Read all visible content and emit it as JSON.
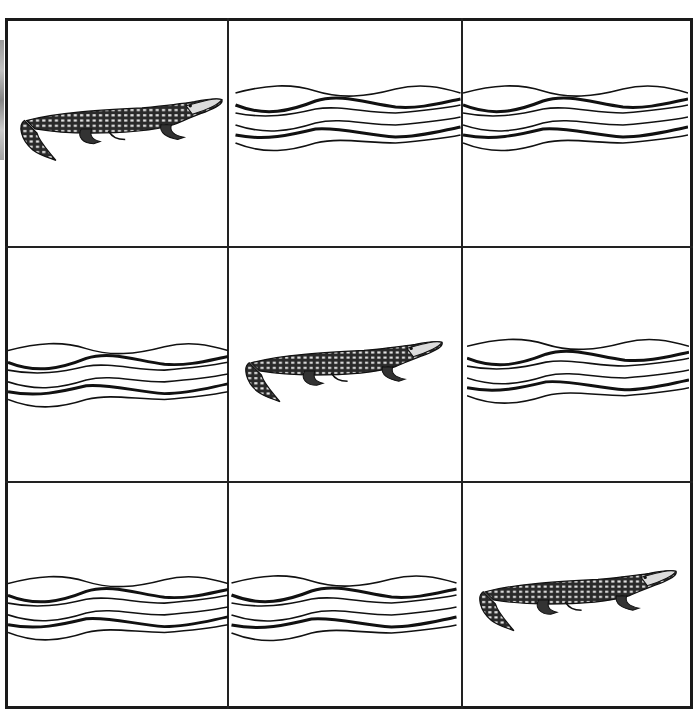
{
  "puzzle": {
    "title": "Crocodile and water grid",
    "rows": 3,
    "cols": 3,
    "cells": [
      {
        "row": 1,
        "col": 1,
        "content": "crocodile"
      },
      {
        "row": 1,
        "col": 2,
        "content": "water"
      },
      {
        "row": 1,
        "col": 3,
        "content": "water"
      },
      {
        "row": 2,
        "col": 1,
        "content": "water"
      },
      {
        "row": 2,
        "col": 2,
        "content": "crocodile"
      },
      {
        "row": 2,
        "col": 3,
        "content": "water"
      },
      {
        "row": 3,
        "col": 1,
        "content": "water"
      },
      {
        "row": 3,
        "col": 2,
        "content": "water"
      },
      {
        "row": 3,
        "col": 3,
        "content": "crocodile"
      }
    ],
    "colors": {
      "ink": "#1a1a1a",
      "background": "#ffffff"
    }
  }
}
